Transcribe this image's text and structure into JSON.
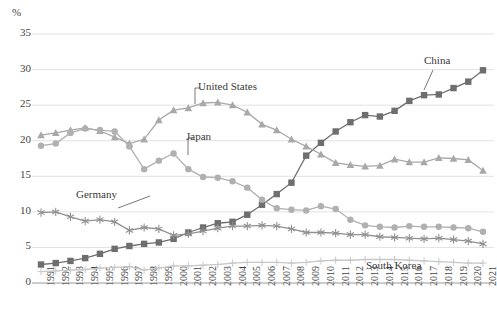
{
  "chart_data": {
    "type": "line",
    "title": "",
    "subtitle": "",
    "xlabel": "",
    "ylabel": "%",
    "ylim": [
      0,
      35
    ],
    "yticks": [
      0,
      5,
      10,
      15,
      20,
      25,
      30,
      35
    ],
    "grid": true,
    "legend_position": "inline-annotations",
    "x": [
      "1991",
      "1992",
      "1993",
      "1994",
      "1995",
      "1996",
      "1997",
      "1998",
      "1999",
      "2000",
      "2001",
      "2002",
      "2003",
      "2004",
      "2005",
      "2006",
      "2007",
      "2008",
      "2009",
      "2010",
      "2011",
      "2012",
      "2013",
      "2014",
      "2015",
      "2016",
      "2017",
      "2018",
      "2019",
      "2020",
      "2021"
    ],
    "series": [
      {
        "name": "China",
        "marker": "square",
        "color": "#6e6e6e",
        "values": [
          2.6,
          2.8,
          3.1,
          3.5,
          4.1,
          4.8,
          5.2,
          5.5,
          5.7,
          6.2,
          7.1,
          7.8,
          8.4,
          8.6,
          9.6,
          11.0,
          12.5,
          14.1,
          17.9,
          19.7,
          21.3,
          22.6,
          23.6,
          23.4,
          24.2,
          25.6,
          26.4,
          26.5,
          27.4,
          28.3,
          29.9
        ]
      },
      {
        "name": "United States",
        "marker": "triangle",
        "color": "#a8a8a8",
        "values": [
          20.8,
          21.1,
          21.5,
          21.8,
          21.4,
          20.5,
          19.6,
          20.2,
          22.9,
          24.3,
          24.6,
          25.3,
          25.4,
          25.0,
          24.0,
          22.3,
          21.5,
          20.2,
          19.2,
          18.1,
          16.9,
          16.6,
          16.4,
          16.5,
          17.4,
          17.0,
          17.0,
          17.6,
          17.5,
          17.3,
          15.8
        ]
      },
      {
        "name": "Japan",
        "marker": "circle",
        "color": "#b0b0b0",
        "values": [
          19.3,
          19.6,
          21.1,
          21.7,
          21.5,
          21.3,
          19.2,
          16.0,
          17.2,
          18.2,
          16.0,
          14.9,
          14.8,
          14.3,
          13.4,
          11.7,
          10.5,
          10.3,
          10.2,
          10.8,
          10.4,
          8.9,
          8.1,
          7.9,
          7.8,
          8.0,
          7.9,
          7.9,
          7.8,
          7.7,
          7.2
        ]
      },
      {
        "name": "Germany",
        "marker": "asterisk",
        "color": "#909090",
        "values": [
          9.9,
          10.0,
          9.3,
          8.7,
          8.9,
          8.6,
          7.4,
          7.8,
          7.6,
          6.7,
          6.9,
          7.3,
          7.7,
          8.0,
          8.0,
          8.1,
          8.0,
          7.6,
          7.1,
          7.1,
          7.0,
          6.8,
          6.8,
          6.5,
          6.4,
          6.3,
          6.2,
          6.3,
          6.1,
          5.9,
          5.5
        ]
      },
      {
        "name": "South Korea",
        "marker": "plus",
        "color": "#c8c8c8",
        "values": [
          1.6,
          1.7,
          1.8,
          1.9,
          2.1,
          2.2,
          2.3,
          1.8,
          2.1,
          2.4,
          2.4,
          2.5,
          2.6,
          2.8,
          2.9,
          2.9,
          2.9,
          2.8,
          2.9,
          3.1,
          3.2,
          3.2,
          3.3,
          3.3,
          3.3,
          3.2,
          3.1,
          3.0,
          2.9,
          2.8,
          2.8
        ]
      }
    ],
    "annotations": [
      {
        "text": "United States",
        "series": "United States"
      },
      {
        "text": "Japan",
        "series": "Japan"
      },
      {
        "text": "Germany",
        "series": "Germany"
      },
      {
        "text": "China",
        "series": "China"
      },
      {
        "text": "South Korea",
        "series": "South Korea"
      }
    ]
  },
  "axis": {
    "unit_label": "%",
    "ytick_labels": [
      "35",
      "30",
      "25",
      "20",
      "15",
      "10",
      "5",
      "0"
    ],
    "xtick_labels": [
      "1991",
      "1992",
      "1993",
      "1994",
      "1995",
      "1996",
      "1997",
      "1998",
      "1999",
      "2000",
      "2001",
      "2002",
      "2003",
      "2004",
      "2005",
      "2006",
      "2007",
      "2008",
      "2009",
      "2010",
      "2011",
      "2012",
      "2013",
      "2014",
      "2015",
      "2016",
      "2017",
      "2018",
      "2019",
      "2020",
      "2021"
    ]
  },
  "labels": {
    "united_states": "United States",
    "japan": "Japan",
    "germany": "Germany",
    "china": "China",
    "south_korea": "South Korea"
  }
}
